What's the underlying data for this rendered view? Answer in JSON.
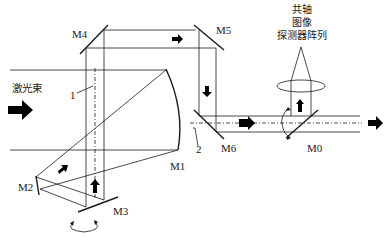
{
  "diagram": {
    "type": "optical-path-schematic",
    "labels": {
      "laser_beam": "激光束",
      "m0": "M0",
      "m1": "M1",
      "m2": "M2",
      "m3": "M3",
      "m4": "M4",
      "m5": "M5",
      "m6": "M6",
      "marker_1": "1",
      "marker_2": "2",
      "detector_line1": "共轴",
      "detector_line2": "图像",
      "detector_line3": "探测器阵列"
    },
    "components": [
      {
        "id": "M0",
        "kind": "beam-splitter"
      },
      {
        "id": "M1",
        "kind": "curved-mirror"
      },
      {
        "id": "M2",
        "kind": "mirror"
      },
      {
        "id": "M3",
        "kind": "rotating-mirror"
      },
      {
        "id": "M4",
        "kind": "fold-mirror"
      },
      {
        "id": "M5",
        "kind": "fold-mirror"
      },
      {
        "id": "M6",
        "kind": "fold-mirror"
      },
      {
        "id": "lens",
        "kind": "lens"
      },
      {
        "id": "detector",
        "kind": "coaxial-image-detector-array"
      }
    ],
    "colors": {
      "line": "#1a1a1a",
      "arrow": "#000000",
      "background": "#ffffff"
    }
  }
}
